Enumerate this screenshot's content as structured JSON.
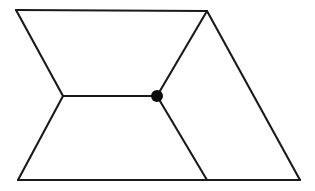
{
  "figure": {
    "background_color": "#ffffff",
    "stroke_color": "#1a1a1a",
    "dot_color": "#0d0d0d",
    "stroke_width": 2.1,
    "canvas": {
      "width": 315,
      "height": 191
    },
    "points": {
      "top_left": {
        "label": "top-left corner",
        "x": 16,
        "y": 10
      },
      "top_right": {
        "label": "top-right apex",
        "x": 207,
        "y": 11
      },
      "left_pinch": {
        "label": "left concave vertex",
        "x": 63,
        "y": 96
      },
      "center_node": {
        "label": "center junction node",
        "x": 157,
        "y": 96
      },
      "bottom_left": {
        "label": "bottom-left corner",
        "x": 18,
        "y": 180
      },
      "bottom_junction": {
        "label": "bottom junction vertex",
        "x": 207,
        "y": 180
      },
      "bottom_right": {
        "label": "bottom-right corner",
        "x": 300,
        "y": 180
      }
    },
    "center_node_radius": 6,
    "segments": [
      {
        "name": "top-edge",
        "from": "top_left",
        "to": "top_right"
      },
      {
        "name": "upper-left-diagonal",
        "from": "top_left",
        "to": "left_pinch"
      },
      {
        "name": "lower-left-diagonal",
        "from": "left_pinch",
        "to": "bottom_left"
      },
      {
        "name": "horizontal-middle",
        "from": "left_pinch",
        "to": "center_node"
      },
      {
        "name": "upper-right-diagonal",
        "from": "center_node",
        "to": "top_right"
      },
      {
        "name": "lower-right-diagonal",
        "from": "center_node",
        "to": "bottom_junction"
      },
      {
        "name": "right-edge",
        "from": "top_right",
        "to": "bottom_right"
      },
      {
        "name": "bottom-edge",
        "from": "bottom_left",
        "to": "bottom_right"
      }
    ]
  }
}
